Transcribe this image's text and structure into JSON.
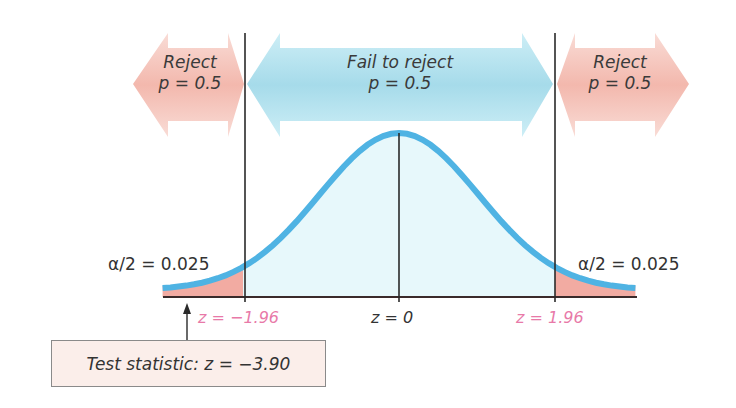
{
  "diagram": {
    "type": "two-tailed hypothesis test, standard normal distribution",
    "regions": [
      {
        "name": "reject-left",
        "label": "Reject",
        "sublabel": "p = 0.5",
        "color": "#f2b5a8"
      },
      {
        "name": "fail-to-reject",
        "label": "Fail to reject",
        "sublabel": "p = 0.5",
        "color": "#9dd6e6"
      },
      {
        "name": "reject-right",
        "label": "Reject",
        "sublabel": "p = 0.5",
        "color": "#f2b5a8"
      }
    ],
    "tail_labels": {
      "left": "α/2 = 0.025",
      "right": "α/2 = 0.025"
    },
    "axis_labels": {
      "left_critical": "z = −1.96",
      "center": "z = 0",
      "right_critical": "z = 1.96"
    },
    "test_statistic": {
      "label": "Test statistic: z = −3.90",
      "value": -3.9
    },
    "colors": {
      "curve": "#4fb3e3",
      "body_fill": "#e6f8fb",
      "tail_fill": "#f2a9a0",
      "critical_label": "#e879a8",
      "axis": "#333333"
    }
  },
  "chart_data": {
    "type": "area",
    "title": "",
    "distribution": "standard normal",
    "mean": 0,
    "critical_values": [
      -1.96,
      1.96
    ],
    "alpha": 0.05,
    "tail_area_each": 0.025,
    "test_statistic": -3.9,
    "x_ticks": [
      "z = −1.96",
      "z = 0",
      "z = 1.96"
    ],
    "xlim": [
      -2.97,
      2.97
    ]
  }
}
